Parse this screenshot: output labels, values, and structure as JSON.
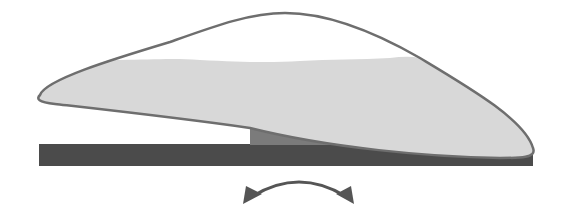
{
  "diagram": {
    "description": "Cap-shaped body resting on a small pedestal atop a flat base plate, with a curved double-headed arrow below indicating rocking motion",
    "labels": [],
    "elements": {
      "body": {
        "name": "cap-body",
        "outline_color": "#6e6e6e",
        "fill_color": "#d8d8d8",
        "upper_color": "#ffffff"
      },
      "pedestal": {
        "name": "pedestal",
        "color": "#7b7b7b"
      },
      "base": {
        "name": "base-plate",
        "color": "#4b4b4b"
      },
      "arrow": {
        "name": "rocking-arrow",
        "type": "double-headed-curved",
        "color": "#555555"
      }
    }
  }
}
